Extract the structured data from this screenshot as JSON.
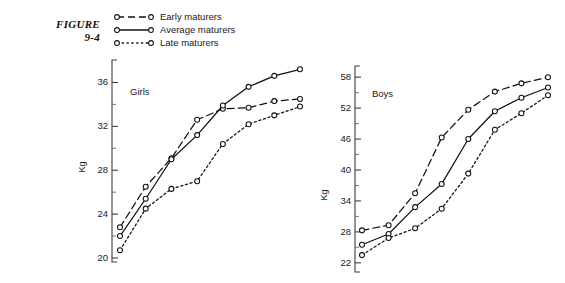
{
  "figure": {
    "label_line1": "FIGURE",
    "label_line2": "9-4"
  },
  "legend": {
    "position": "top-left",
    "items": [
      {
        "label": "Early maturers",
        "dash": "long-dash",
        "marker": "open-circle"
      },
      {
        "label": "Average maturers",
        "dash": "solid",
        "marker": "open-circle"
      },
      {
        "label": "Late maturers",
        "dash": "short-dot",
        "marker": "open-circle"
      }
    ]
  },
  "chart_data": [
    {
      "type": "line",
      "title": "Girls",
      "xlabel": "",
      "ylabel": "Kg",
      "ylim": [
        20,
        37.5
      ],
      "yticks": [
        20,
        24,
        28,
        32,
        36
      ],
      "minor_ticks": true,
      "grid": false,
      "x": [
        1,
        2,
        3,
        4,
        5,
        6,
        7,
        8
      ],
      "series": [
        {
          "name": "Early maturers",
          "dash": "long-dash",
          "values": [
            22.8,
            26.5,
            29.1,
            32.6,
            33.6,
            33.7,
            34.3,
            34.5
          ]
        },
        {
          "name": "Average maturers",
          "dash": "solid",
          "values": [
            22.0,
            25.4,
            29.0,
            31.2,
            33.9,
            35.6,
            36.6,
            37.2
          ]
        },
        {
          "name": "Late maturers",
          "dash": "short-dot",
          "values": [
            20.7,
            24.5,
            26.3,
            27.0,
            30.4,
            32.2,
            33.0,
            33.8
          ]
        }
      ]
    },
    {
      "type": "line",
      "title": "Boys",
      "xlabel": "",
      "ylabel": "Kg",
      "ylim": [
        21,
        59
      ],
      "yticks": [
        22,
        28,
        34,
        40,
        46,
        52,
        58
      ],
      "minor_ticks": true,
      "grid": false,
      "x": [
        1,
        2,
        3,
        4,
        5,
        6,
        7,
        8
      ],
      "series": [
        {
          "name": "Early maturers",
          "dash": "long-dash",
          "values": [
            28.3,
            29.3,
            35.5,
            46.3,
            51.7,
            55.2,
            56.8,
            58.0
          ]
        },
        {
          "name": "Average maturers",
          "dash": "solid",
          "values": [
            25.5,
            27.6,
            32.8,
            37.3,
            46.0,
            51.4,
            54.0,
            56.0
          ]
        },
        {
          "name": "Late maturers",
          "dash": "short-dot",
          "values": [
            23.5,
            26.8,
            28.7,
            32.5,
            39.3,
            47.8,
            51.0,
            54.5
          ]
        }
      ]
    }
  ]
}
